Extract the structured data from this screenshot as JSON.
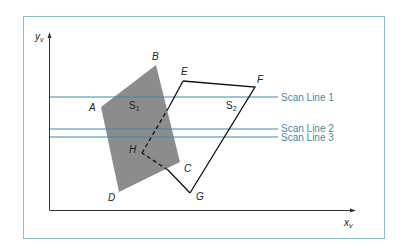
{
  "figure": {
    "axes": {
      "y_label": "y",
      "y_sub": "v",
      "x_label": "x",
      "x_sub": "v"
    },
    "surfaces": [
      {
        "name": "S",
        "sub": "1",
        "fill": "#8c8c8c"
      },
      {
        "name": "S",
        "sub": "2",
        "stroke": "#111111"
      }
    ],
    "vertices": {
      "A": "A",
      "B": "B",
      "C": "C",
      "D": "D",
      "E": "E",
      "F": "F",
      "G": "G",
      "H": "H"
    },
    "scan_lines": [
      {
        "label": "Scan Line 1"
      },
      {
        "label": "Scan Line 2"
      },
      {
        "label": "Scan Line 3"
      }
    ],
    "colors": {
      "frame": "#8fbccc",
      "scan_line": "#3f8aa5",
      "surface1_fill": "#8c8c8c",
      "axis": "#333333"
    }
  }
}
